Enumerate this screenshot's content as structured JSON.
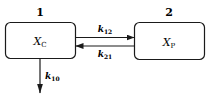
{
  "diagram": {
    "type": "two-compartment pharmacokinetic model",
    "compartments": [
      {
        "id": "1",
        "label": "1",
        "variable": "X",
        "subscript": "C"
      },
      {
        "id": "2",
        "label": "2",
        "variable": "X",
        "subscript": "P"
      }
    ],
    "rates": [
      {
        "from": "1",
        "to": "2",
        "symbol": "k",
        "subscript": "12"
      },
      {
        "from": "2",
        "to": "1",
        "symbol": "k",
        "subscript": "21"
      },
      {
        "from": "1",
        "to": "out",
        "symbol": "k",
        "subscript": "10"
      }
    ],
    "colors": {
      "line": "#1a1a1a",
      "background": "#ffffff"
    }
  }
}
